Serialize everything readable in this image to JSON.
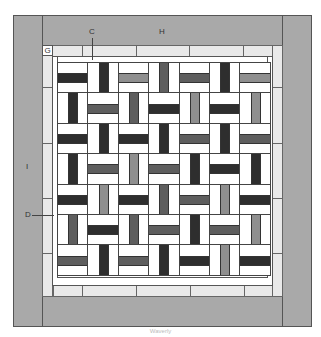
{
  "labels": {
    "C": "C",
    "H": "H",
    "G": "G",
    "I": "I",
    "D": "D"
  },
  "footer": "Waverly",
  "colors": {
    "outer_border": "#a9a9a9",
    "inner_border": "#e9e9e9",
    "background": "#ffffff",
    "dark": "#2e2e2e",
    "mid": "#5e5e5e",
    "light": "#8f8f8f"
  },
  "grid": {
    "rows": 7,
    "cols": 7,
    "origin_x": 57,
    "origin_y": 62,
    "block_size": 30.4,
    "blocks": [
      [
        [
          "H",
          "dark"
        ],
        [
          "V",
          "dark"
        ],
        [
          "H",
          "light"
        ],
        [
          "V",
          "mid"
        ],
        [
          "H",
          "mid"
        ],
        [
          "V",
          "dark"
        ],
        [
          "H",
          "light"
        ]
      ],
      [
        [
          "V",
          "dark"
        ],
        [
          "H",
          "mid"
        ],
        [
          "V",
          "mid"
        ],
        [
          "H",
          "dark"
        ],
        [
          "V",
          "light"
        ],
        [
          "H",
          "dark"
        ],
        [
          "V",
          "light"
        ]
      ],
      [
        [
          "H",
          "dark"
        ],
        [
          "V",
          "dark"
        ],
        [
          "H",
          "dark"
        ],
        [
          "V",
          "dark"
        ],
        [
          "H",
          "mid"
        ],
        [
          "V",
          "dark"
        ],
        [
          "H",
          "mid"
        ]
      ],
      [
        [
          "V",
          "dark"
        ],
        [
          "H",
          "mid"
        ],
        [
          "V",
          "light"
        ],
        [
          "H",
          "mid"
        ],
        [
          "V",
          "dark"
        ],
        [
          "H",
          "dark"
        ],
        [
          "V",
          "dark"
        ]
      ],
      [
        [
          "H",
          "dark"
        ],
        [
          "V",
          "light"
        ],
        [
          "H",
          "dark"
        ],
        [
          "V",
          "mid"
        ],
        [
          "H",
          "mid"
        ],
        [
          "V",
          "light"
        ],
        [
          "H",
          "dark"
        ]
      ],
      [
        [
          "V",
          "mid"
        ],
        [
          "H",
          "dark"
        ],
        [
          "V",
          "mid"
        ],
        [
          "H",
          "mid"
        ],
        [
          "V",
          "dark"
        ],
        [
          "H",
          "mid"
        ],
        [
          "V",
          "light"
        ]
      ],
      [
        [
          "H",
          "mid"
        ],
        [
          "V",
          "dark"
        ],
        [
          "H",
          "mid"
        ],
        [
          "V",
          "dark"
        ],
        [
          "H",
          "dark"
        ],
        [
          "V",
          "light"
        ],
        [
          "H",
          "dark"
        ]
      ]
    ]
  },
  "inner_border": {
    "top_dividers": [
      82,
      136,
      189,
      243
    ],
    "bottom_dividers": [
      53,
      82,
      136,
      190,
      244
    ],
    "left_dividers": [
      87,
      143,
      198,
      253
    ],
    "right_dividers": [
      87,
      143,
      198,
      253
    ]
  }
}
